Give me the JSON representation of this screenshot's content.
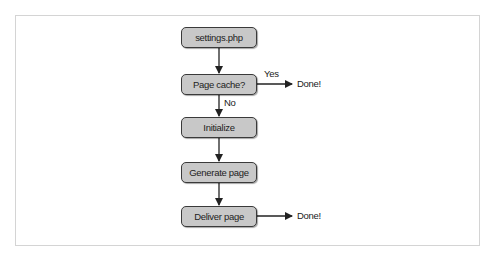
{
  "diagram": {
    "type": "flowchart",
    "nodes": [
      {
        "id": "settings",
        "label": "settings.php"
      },
      {
        "id": "cache",
        "label": "Page cache?"
      },
      {
        "id": "init",
        "label": "Initialize"
      },
      {
        "id": "generate",
        "label": "Generate page"
      },
      {
        "id": "deliver",
        "label": "Deliver page"
      }
    ],
    "edge_labels": {
      "yes": "Yes",
      "no": "No"
    },
    "terminals": {
      "done_cache": "Done!",
      "done_deliver": "Done!"
    },
    "edges": [
      {
        "from": "settings",
        "to": "cache"
      },
      {
        "from": "cache",
        "to": "done_cache",
        "label": "Yes"
      },
      {
        "from": "cache",
        "to": "init",
        "label": "No"
      },
      {
        "from": "init",
        "to": "generate"
      },
      {
        "from": "generate",
        "to": "deliver"
      },
      {
        "from": "deliver",
        "to": "done_deliver"
      }
    ],
    "colors": {
      "node_fill": "#c8c8c8",
      "node_border": "#3a3a3a",
      "frame_border": "#d4d4d4"
    }
  }
}
